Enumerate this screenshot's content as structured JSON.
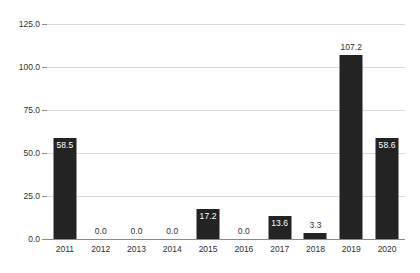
{
  "chart_data": {
    "type": "bar",
    "title": "",
    "subtitle": "",
    "xlabel": "",
    "ylabel": "",
    "categories": [
      "2011",
      "2012",
      "2013",
      "2014",
      "2015",
      "2016",
      "2017",
      "2018",
      "2019",
      "2020"
    ],
    "values": [
      58.5,
      0.0,
      0.0,
      0.0,
      17.2,
      0.0,
      13.6,
      3.3,
      107.2,
      58.6
    ],
    "data_labels": [
      "58.5",
      "0.0",
      "0.0",
      "0.0",
      "17.2",
      "0.0",
      "13.6",
      "3.3",
      "107.2",
      "58.6"
    ],
    "label_placement": [
      "inside",
      "outside",
      "outside",
      "outside",
      "inside",
      "outside",
      "inside",
      "outside",
      "outside",
      "inside"
    ],
    "ylim": [
      0.0,
      125.0
    ],
    "yticks": [
      0.0,
      25.0,
      50.0,
      75.0,
      100.0,
      125.0
    ],
    "ytick_labels": [
      "0.0",
      "25.0",
      "50.0",
      "75.0",
      "100.0",
      "125.0"
    ],
    "grid": true,
    "legend": false,
    "legend_position": "none",
    "series": [
      {
        "name": "",
        "values": [
          58.5,
          0.0,
          0.0,
          0.0,
          17.2,
          0.0,
          13.6,
          3.3,
          107.2,
          58.6
        ]
      }
    ]
  },
  "colors": {
    "bar": "#232323",
    "gridline": "#d9d9d9",
    "axis": "#8a8a8a",
    "background": "#ffffff",
    "tick_text": "#2f2f2f",
    "label_inside_text": "#ffffff",
    "label_outside_text": "#2f2f2f"
  }
}
